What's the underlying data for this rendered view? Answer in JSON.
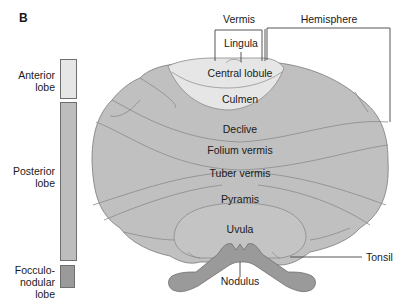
{
  "panel_label": "B",
  "colors": {
    "anterior": "#e6e6e6",
    "posterior": "#bdbdbd",
    "flocculonodular": "#9a9a9a",
    "outline": "#6f6f6f"
  },
  "lobes": [
    {
      "name": "Anterior lobe",
      "line1": "Anterior",
      "line2": "lobe"
    },
    {
      "name": "Posterior lobe",
      "line1": "Posterior",
      "line2": "lobe"
    },
    {
      "name": "Flocculonodular lobe",
      "line1": "Focculo-",
      "line2": "nodular",
      "line3": "lobe"
    }
  ],
  "top_labels": {
    "vermis": "Vermis",
    "hemisphere": "Hemisphere"
  },
  "regions": {
    "lingula": "Lingula",
    "central_lobule": "Central lobule",
    "culmen": "Culmen",
    "declive": "Declive",
    "folium_vermis": "Folium vermis",
    "tuber_vermis": "Tuber vermis",
    "pyramis": "Pyramis",
    "uvula": "Uvula",
    "nodulus": "Nodulus",
    "tonsil": "Tonsil"
  }
}
